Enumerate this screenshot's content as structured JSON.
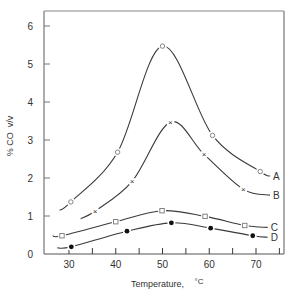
{
  "chart_data": {
    "type": "line",
    "title": "",
    "xlabel": "Temperature,  °C",
    "ylabel": "% CO  v/v",
    "xlim": [
      25,
      76
    ],
    "ylim": [
      0,
      6.6
    ],
    "xticks_major": [
      30,
      40,
      50,
      60,
      70
    ],
    "xticks_minor": [
      35,
      45,
      55,
      65,
      75
    ],
    "yticks": [
      0,
      1,
      2,
      3,
      4,
      5,
      6
    ],
    "grid": false,
    "legend": "curve end labels (A, B, C, D) at right",
    "series": [
      {
        "name": "A",
        "marker": "open-circle",
        "x": [
          30.4,
          40.4,
          50,
          60.7,
          70.9
        ],
        "values": [
          1.37,
          2.68,
          5.47,
          3.12,
          2.17
        ],
        "curve_start": [
          28,
          1.15
        ],
        "curve_end": [
          73,
          2.05
        ]
      },
      {
        "name": "B",
        "marker": "x",
        "x": [
          35.6,
          43.5,
          51.7,
          58.9,
          67.3
        ],
        "values": [
          1.13,
          1.91,
          3.47,
          2.62,
          1.7
        ],
        "curve_start": [
          32.5,
          0.93
        ],
        "curve_end": [
          73,
          1.55
        ]
      },
      {
        "name": "C",
        "marker": "open-square",
        "x": [
          28.5,
          40,
          49.9,
          59.1,
          67.6
        ],
        "values": [
          0.48,
          0.85,
          1.14,
          0.99,
          0.75
        ],
        "curve_start": [
          26.5,
          0.48
        ],
        "curve_end": [
          72.5,
          0.7
        ]
      },
      {
        "name": "D",
        "marker": "filled-circle",
        "x": [
          30.5,
          42.4,
          51.9,
          60.3,
          69.3
        ],
        "values": [
          0.19,
          0.6,
          0.82,
          0.68,
          0.48
        ],
        "curve_start": [
          27.5,
          0.16
        ],
        "curve_end": [
          72.5,
          0.44
        ]
      }
    ]
  },
  "axis": {
    "xlabel": "Temperature,",
    "xunit": "°C",
    "ylabel": "% CO  v/v"
  }
}
